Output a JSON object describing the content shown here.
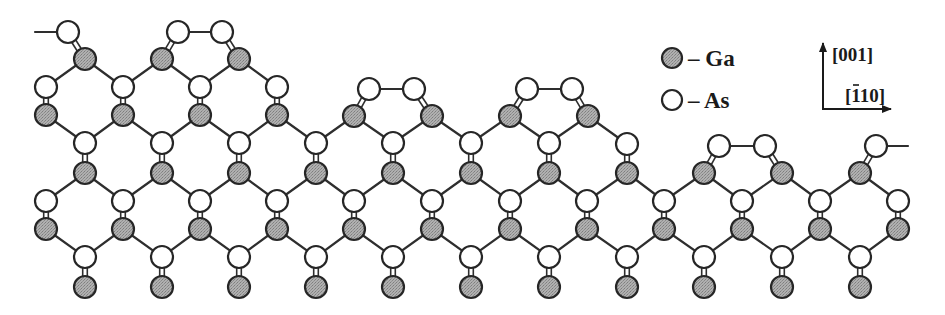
{
  "figure": {
    "colors": {
      "ga_fill": "#a3a3a3",
      "as_fill": "#ffffff",
      "outline": "#262626",
      "bond": "#2e2e2e"
    },
    "atom_radius": 11
  },
  "legend": {
    "items": [
      {
        "species": "Ga",
        "label": "– Ga",
        "x": 672,
        "y": 58
      },
      {
        "species": "As",
        "label": "– As",
        "x": 672,
        "y": 100
      }
    ]
  },
  "axes": {
    "origin": {
      "x": 823,
      "y": 109
    },
    "vertical": {
      "to": {
        "x": 823,
        "y": 42
      },
      "label": "[001]",
      "label_x": 833,
      "label_y": 60
    },
    "horizontal": {
      "to": {
        "x": 891,
        "y": 109
      },
      "label_main": "[110]",
      "label_bar_over": "1",
      "label_x": 846,
      "label_y": 101
    }
  },
  "atoms": [
    {
      "id": "t0",
      "el": "As",
      "x": 68,
      "y": 32
    },
    {
      "id": "t1",
      "el": "As",
      "x": 178,
      "y": 32
    },
    {
      "id": "t2",
      "el": "As",
      "x": 222,
      "y": 32
    },
    {
      "id": "g59_0",
      "el": "Ga",
      "x": 85,
      "y": 59
    },
    {
      "id": "g59_1",
      "el": "Ga",
      "x": 162,
      "y": 59
    },
    {
      "id": "g59_2",
      "el": "Ga",
      "x": 239,
      "y": 59
    },
    {
      "id": "a87_0",
      "el": "As",
      "x": 46,
      "y": 87
    },
    {
      "id": "a87_1",
      "el": "As",
      "x": 123,
      "y": 87
    },
    {
      "id": "a87_2",
      "el": "As",
      "x": 200,
      "y": 87
    },
    {
      "id": "a87_3",
      "el": "As",
      "x": 277,
      "y": 87
    },
    {
      "id": "m4",
      "el": "As",
      "x": 369,
      "y": 89
    },
    {
      "id": "m5",
      "el": "As",
      "x": 414,
      "y": 89
    },
    {
      "id": "m6",
      "el": "As",
      "x": 527,
      "y": 89
    },
    {
      "id": "m7",
      "el": "As",
      "x": 572,
      "y": 89
    },
    {
      "id": "g115_0",
      "el": "Ga",
      "x": 46,
      "y": 115
    },
    {
      "id": "g115_1",
      "el": "Ga",
      "x": 123,
      "y": 115
    },
    {
      "id": "g115_2",
      "el": "Ga",
      "x": 200,
      "y": 115
    },
    {
      "id": "g115_3",
      "el": "Ga",
      "x": 277,
      "y": 115
    },
    {
      "id": "g115_4",
      "el": "Ga",
      "x": 354,
      "y": 116
    },
    {
      "id": "g115_5",
      "el": "Ga",
      "x": 432,
      "y": 116
    },
    {
      "id": "g115_6",
      "el": "Ga",
      "x": 510,
      "y": 116
    },
    {
      "id": "g115_7",
      "el": "Ga",
      "x": 588,
      "y": 116
    },
    {
      "id": "a143_0",
      "el": "As",
      "x": 85,
      "y": 143
    },
    {
      "id": "a143_1",
      "el": "As",
      "x": 162,
      "y": 143
    },
    {
      "id": "a143_2",
      "el": "As",
      "x": 239,
      "y": 143
    },
    {
      "id": "a143_3",
      "el": "As",
      "x": 316,
      "y": 143
    },
    {
      "id": "a143_4",
      "el": "As",
      "x": 393,
      "y": 143
    },
    {
      "id": "a143_5",
      "el": "As",
      "x": 471,
      "y": 143
    },
    {
      "id": "a143_6",
      "el": "As",
      "x": 549,
      "y": 143
    },
    {
      "id": "a143_7",
      "el": "As",
      "x": 627,
      "y": 144
    },
    {
      "id": "r8",
      "el": "As",
      "x": 719,
      "y": 146
    },
    {
      "id": "r9",
      "el": "As",
      "x": 765,
      "y": 146
    },
    {
      "id": "r10",
      "el": "As",
      "x": 876,
      "y": 146
    },
    {
      "id": "g173_0",
      "el": "Ga",
      "x": 85,
      "y": 173
    },
    {
      "id": "g173_1",
      "el": "Ga",
      "x": 162,
      "y": 173
    },
    {
      "id": "g173_2",
      "el": "Ga",
      "x": 239,
      "y": 173
    },
    {
      "id": "g173_3",
      "el": "Ga",
      "x": 316,
      "y": 173
    },
    {
      "id": "g173_4",
      "el": "Ga",
      "x": 393,
      "y": 173
    },
    {
      "id": "g173_5",
      "el": "Ga",
      "x": 471,
      "y": 173
    },
    {
      "id": "g173_6",
      "el": "Ga",
      "x": 549,
      "y": 173
    },
    {
      "id": "g173_7",
      "el": "Ga",
      "x": 627,
      "y": 173
    },
    {
      "id": "g173_8",
      "el": "Ga",
      "x": 704,
      "y": 173
    },
    {
      "id": "g173_9",
      "el": "Ga",
      "x": 782,
      "y": 173
    },
    {
      "id": "g173_10",
      "el": "Ga",
      "x": 860,
      "y": 173
    },
    {
      "id": "a201_0",
      "el": "As",
      "x": 46,
      "y": 201
    },
    {
      "id": "a201_1",
      "el": "As",
      "x": 123,
      "y": 201
    },
    {
      "id": "a201_2",
      "el": "As",
      "x": 200,
      "y": 201
    },
    {
      "id": "a201_3",
      "el": "As",
      "x": 277,
      "y": 201
    },
    {
      "id": "a201_4",
      "el": "As",
      "x": 354,
      "y": 201
    },
    {
      "id": "a201_5",
      "el": "As",
      "x": 432,
      "y": 201
    },
    {
      "id": "a201_6",
      "el": "As",
      "x": 510,
      "y": 201
    },
    {
      "id": "a201_7",
      "el": "As",
      "x": 587,
      "y": 201
    },
    {
      "id": "a201_8",
      "el": "As",
      "x": 664,
      "y": 201
    },
    {
      "id": "a201_9",
      "el": "As",
      "x": 742,
      "y": 201
    },
    {
      "id": "a201_10",
      "el": "As",
      "x": 820,
      "y": 201
    },
    {
      "id": "a201_11",
      "el": "As",
      "x": 898,
      "y": 201
    },
    {
      "id": "g229_0",
      "el": "Ga",
      "x": 46,
      "y": 229
    },
    {
      "id": "g229_1",
      "el": "Ga",
      "x": 123,
      "y": 229
    },
    {
      "id": "g229_2",
      "el": "Ga",
      "x": 200,
      "y": 229
    },
    {
      "id": "g229_3",
      "el": "Ga",
      "x": 277,
      "y": 229
    },
    {
      "id": "g229_4",
      "el": "Ga",
      "x": 354,
      "y": 229
    },
    {
      "id": "g229_5",
      "el": "Ga",
      "x": 432,
      "y": 229
    },
    {
      "id": "g229_6",
      "el": "Ga",
      "x": 510,
      "y": 229
    },
    {
      "id": "g229_7",
      "el": "Ga",
      "x": 587,
      "y": 229
    },
    {
      "id": "g229_8",
      "el": "Ga",
      "x": 664,
      "y": 229
    },
    {
      "id": "g229_9",
      "el": "Ga",
      "x": 742,
      "y": 229
    },
    {
      "id": "g229_10",
      "el": "Ga",
      "x": 820,
      "y": 229
    },
    {
      "id": "g229_11",
      "el": "Ga",
      "x": 898,
      "y": 229
    },
    {
      "id": "a257_0",
      "el": "As",
      "x": 85,
      "y": 257
    },
    {
      "id": "a257_1",
      "el": "As",
      "x": 162,
      "y": 257
    },
    {
      "id": "a257_2",
      "el": "As",
      "x": 239,
      "y": 257
    },
    {
      "id": "a257_3",
      "el": "As",
      "x": 316,
      "y": 257
    },
    {
      "id": "a257_4",
      "el": "As",
      "x": 393,
      "y": 257
    },
    {
      "id": "a257_5",
      "el": "As",
      "x": 471,
      "y": 257
    },
    {
      "id": "a257_6",
      "el": "As",
      "x": 549,
      "y": 257
    },
    {
      "id": "a257_7",
      "el": "As",
      "x": 627,
      "y": 257
    },
    {
      "id": "a257_8",
      "el": "As",
      "x": 704,
      "y": 257
    },
    {
      "id": "a257_9",
      "el": "As",
      "x": 782,
      "y": 257
    },
    {
      "id": "a257_10",
      "el": "As",
      "x": 860,
      "y": 257
    },
    {
      "id": "g287_0",
      "el": "Ga",
      "x": 85,
      "y": 287
    },
    {
      "id": "g287_1",
      "el": "Ga",
      "x": 162,
      "y": 287
    },
    {
      "id": "g287_2",
      "el": "Ga",
      "x": 239,
      "y": 287
    },
    {
      "id": "g287_3",
      "el": "Ga",
      "x": 316,
      "y": 287
    },
    {
      "id": "g287_4",
      "el": "Ga",
      "x": 393,
      "y": 287
    },
    {
      "id": "g287_5",
      "el": "Ga",
      "x": 471,
      "y": 287
    },
    {
      "id": "g287_6",
      "el": "Ga",
      "x": 549,
      "y": 287
    },
    {
      "id": "g287_7",
      "el": "Ga",
      "x": 627,
      "y": 287
    },
    {
      "id": "g287_8",
      "el": "Ga",
      "x": 704,
      "y": 287
    },
    {
      "id": "g287_9",
      "el": "Ga",
      "x": 782,
      "y": 287
    },
    {
      "id": "g287_10",
      "el": "Ga",
      "x": 860,
      "y": 287
    }
  ],
  "dangling_bonds": [
    {
      "from": "t0",
      "to_x": 35,
      "to_y": 32
    },
    {
      "from": "r10",
      "to_x": 908,
      "to_y": 146
    }
  ],
  "dimer_bonds": [
    [
      "t1",
      "t2"
    ],
    [
      "m4",
      "m5"
    ],
    [
      "m6",
      "m7"
    ],
    [
      "r8",
      "r9"
    ]
  ],
  "double_bonds": [
    [
      "t0",
      "g59_0"
    ],
    [
      "t1",
      "g59_1"
    ],
    [
      "t2",
      "g59_2"
    ],
    [
      "a87_0",
      "g115_0"
    ],
    [
      "a87_1",
      "g115_1"
    ],
    [
      "a87_2",
      "g115_2"
    ],
    [
      "a87_3",
      "g115_3"
    ],
    [
      "m4",
      "g115_4"
    ],
    [
      "m5",
      "g115_5"
    ],
    [
      "m6",
      "g115_6"
    ],
    [
      "m7",
      "g115_7"
    ],
    [
      "a143_0",
      "g173_0"
    ],
    [
      "a143_1",
      "g173_1"
    ],
    [
      "a143_2",
      "g173_2"
    ],
    [
      "a143_3",
      "g173_3"
    ],
    [
      "a143_4",
      "g173_4"
    ],
    [
      "a143_5",
      "g173_5"
    ],
    [
      "a143_6",
      "g173_6"
    ],
    [
      "a143_7",
      "g173_7"
    ],
    [
      "r8",
      "g173_8"
    ],
    [
      "r9",
      "g173_9"
    ],
    [
      "r10",
      "g173_10"
    ],
    [
      "a201_0",
      "g229_0"
    ],
    [
      "a201_1",
      "g229_1"
    ],
    [
      "a201_2",
      "g229_2"
    ],
    [
      "a201_3",
      "g229_3"
    ],
    [
      "a201_4",
      "g229_4"
    ],
    [
      "a201_5",
      "g229_5"
    ],
    [
      "a201_6",
      "g229_6"
    ],
    [
      "a201_7",
      "g229_7"
    ],
    [
      "a201_8",
      "g229_8"
    ],
    [
      "a201_9",
      "g229_9"
    ],
    [
      "a201_10",
      "g229_10"
    ],
    [
      "a201_11",
      "g229_11"
    ],
    [
      "a257_0",
      "g287_0"
    ],
    [
      "a257_1",
      "g287_1"
    ],
    [
      "a257_2",
      "g287_2"
    ],
    [
      "a257_3",
      "g287_3"
    ],
    [
      "a257_4",
      "g287_4"
    ],
    [
      "a257_5",
      "g287_5"
    ],
    [
      "a257_6",
      "g287_6"
    ],
    [
      "a257_7",
      "g287_7"
    ],
    [
      "a257_8",
      "g287_8"
    ],
    [
      "a257_9",
      "g287_9"
    ],
    [
      "a257_10",
      "g287_10"
    ]
  ],
  "single_bonds": [
    [
      "g59_0",
      "a87_0"
    ],
    [
      "g59_0",
      "a87_1"
    ],
    [
      "g59_1",
      "a87_1"
    ],
    [
      "g59_1",
      "a87_2"
    ],
    [
      "g59_2",
      "a87_2"
    ],
    [
      "g59_2",
      "a87_3"
    ],
    [
      "g115_0",
      "a143_0"
    ],
    [
      "g115_1",
      "a143_0"
    ],
    [
      "g115_1",
      "a143_1"
    ],
    [
      "g115_2",
      "a143_1"
    ],
    [
      "g115_2",
      "a143_2"
    ],
    [
      "g115_3",
      "a143_2"
    ],
    [
      "g115_3",
      "a143_3"
    ],
    [
      "g115_4",
      "a143_3"
    ],
    [
      "g115_4",
      "a143_4"
    ],
    [
      "g115_5",
      "a143_4"
    ],
    [
      "g115_5",
      "a143_5"
    ],
    [
      "g115_6",
      "a143_5"
    ],
    [
      "g115_6",
      "a143_6"
    ],
    [
      "g115_7",
      "a143_6"
    ],
    [
      "g115_7",
      "a143_7"
    ],
    [
      "g173_0",
      "a201_0"
    ],
    [
      "g173_0",
      "a201_1"
    ],
    [
      "g173_1",
      "a201_1"
    ],
    [
      "g173_1",
      "a201_2"
    ],
    [
      "g173_2",
      "a201_2"
    ],
    [
      "g173_2",
      "a201_3"
    ],
    [
      "g173_3",
      "a201_3"
    ],
    [
      "g173_3",
      "a201_4"
    ],
    [
      "g173_4",
      "a201_4"
    ],
    [
      "g173_4",
      "a201_5"
    ],
    [
      "g173_5",
      "a201_5"
    ],
    [
      "g173_5",
      "a201_6"
    ],
    [
      "g173_6",
      "a201_6"
    ],
    [
      "g173_6",
      "a201_7"
    ],
    [
      "g173_7",
      "a201_7"
    ],
    [
      "g173_7",
      "a201_8"
    ],
    [
      "g173_8",
      "a201_8"
    ],
    [
      "g173_8",
      "a201_9"
    ],
    [
      "g173_9",
      "a201_9"
    ],
    [
      "g173_9",
      "a201_10"
    ],
    [
      "g173_10",
      "a201_10"
    ],
    [
      "g173_10",
      "a201_11"
    ],
    [
      "g229_0",
      "a257_0"
    ],
    [
      "g229_1",
      "a257_0"
    ],
    [
      "g229_1",
      "a257_1"
    ],
    [
      "g229_2",
      "a257_1"
    ],
    [
      "g229_2",
      "a257_2"
    ],
    [
      "g229_3",
      "a257_2"
    ],
    [
      "g229_3",
      "a257_3"
    ],
    [
      "g229_4",
      "a257_3"
    ],
    [
      "g229_4",
      "a257_4"
    ],
    [
      "g229_5",
      "a257_4"
    ],
    [
      "g229_5",
      "a257_5"
    ],
    [
      "g229_6",
      "a257_5"
    ],
    [
      "g229_6",
      "a257_6"
    ],
    [
      "g229_7",
      "a257_6"
    ],
    [
      "g229_7",
      "a257_7"
    ],
    [
      "g229_8",
      "a257_7"
    ],
    [
      "g229_8",
      "a257_8"
    ],
    [
      "g229_9",
      "a257_8"
    ],
    [
      "g229_9",
      "a257_9"
    ],
    [
      "g229_10",
      "a257_9"
    ],
    [
      "g229_10",
      "a257_10"
    ],
    [
      "g229_11",
      "a257_10"
    ]
  ]
}
